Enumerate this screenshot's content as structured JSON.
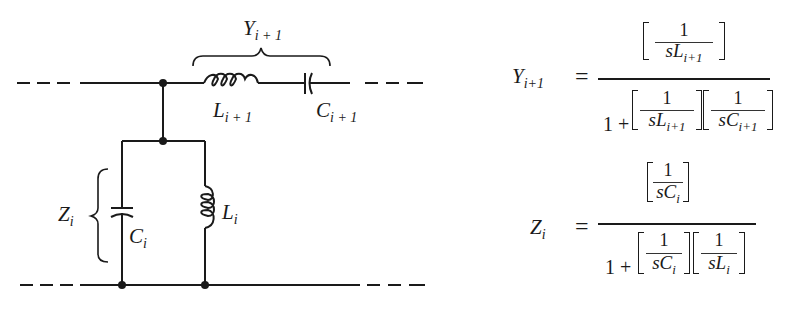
{
  "diagram": {
    "type": "ladder-network-section",
    "labels": {
      "Y_series": {
        "base": "Y",
        "sub": "i + 1"
      },
      "L_series": {
        "base": "L",
        "sub": "i + 1"
      },
      "C_series": {
        "base": "C",
        "sub": "i + 1"
      },
      "Z_shunt": {
        "base": "Z",
        "sub": "i"
      },
      "C_shunt": {
        "base": "C",
        "sub": "i"
      },
      "L_shunt": {
        "base": "L",
        "sub": "i"
      }
    },
    "components": [
      {
        "id": "L_i+1",
        "kind": "inductor",
        "branch": "series"
      },
      {
        "id": "C_i+1",
        "kind": "capacitor",
        "branch": "series"
      },
      {
        "id": "C_i",
        "kind": "capacitor",
        "branch": "shunt"
      },
      {
        "id": "L_i",
        "kind": "inductor",
        "branch": "shunt"
      }
    ],
    "colors": {
      "ink": "#1a1a1a",
      "background": "#ffffff"
    }
  },
  "equations": {
    "Y": {
      "lhs": {
        "base": "Y",
        "sub": "i+1"
      },
      "equals": "=",
      "numerator": {
        "num": "1",
        "den_base": "sL",
        "den_sub": "i+1"
      },
      "denominator": {
        "one_plus": "1 +",
        "term1": {
          "num": "1",
          "den_base": "sL",
          "den_sub": "i+1"
        },
        "term2": {
          "num": "1",
          "den_base": "sC",
          "den_sub": "i+1"
        }
      }
    },
    "Z": {
      "lhs": {
        "base": "Z",
        "sub": "i"
      },
      "equals": "=",
      "numerator": {
        "num": "1",
        "den_base": "sC",
        "den_sub": "i"
      },
      "denominator": {
        "one_plus": "1 +",
        "term1": {
          "num": "1",
          "den_base": "sC",
          "den_sub": "i"
        },
        "term2": {
          "num": "1",
          "den_base": "sL",
          "den_sub": "i"
        }
      }
    }
  }
}
